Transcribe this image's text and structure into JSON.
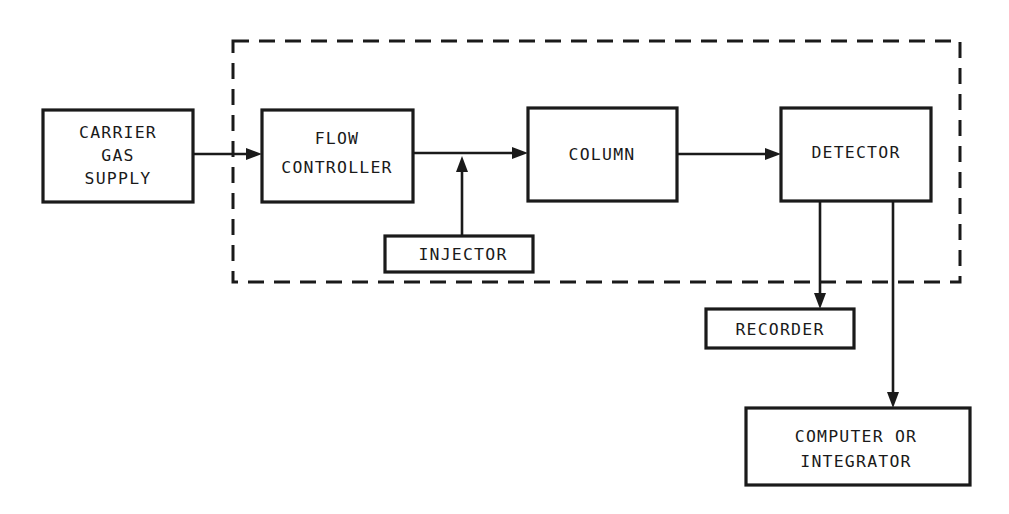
{
  "diagram": {
    "type": "block-diagram",
    "colors": {
      "line": "#1a1a1a",
      "background": "#ffffff"
    },
    "enclosure": {
      "style": "dashed",
      "encloses": [
        "flow_controller",
        "injector",
        "column",
        "detector"
      ]
    },
    "blocks": {
      "carrier_gas_supply": {
        "lines": [
          "CARRIER",
          "GAS",
          "SUPPLY"
        ]
      },
      "flow_controller": {
        "lines": [
          "FLOW",
          "CONTROLLER"
        ]
      },
      "injector": {
        "lines": [
          "INJECTOR"
        ]
      },
      "column": {
        "lines": [
          "COLUMN"
        ]
      },
      "detector": {
        "lines": [
          "DETECTOR"
        ]
      },
      "recorder": {
        "lines": [
          "RECORDER"
        ]
      },
      "computer_or_integrator": {
        "lines": [
          "COMPUTER OR",
          "INTEGRATOR"
        ]
      }
    },
    "connections": [
      {
        "from": "CARRIER GAS SUPPLY",
        "to": "FLOW CONTROLLER"
      },
      {
        "from": "FLOW CONTROLLER",
        "to": "COLUMN"
      },
      {
        "from": "INJECTOR",
        "to": "FLOW CONTROLLER-COLUMN line"
      },
      {
        "from": "COLUMN",
        "to": "DETECTOR"
      },
      {
        "from": "DETECTOR",
        "to": "RECORDER"
      },
      {
        "from": "DETECTOR",
        "to": "COMPUTER OR INTEGRATOR"
      }
    ]
  }
}
